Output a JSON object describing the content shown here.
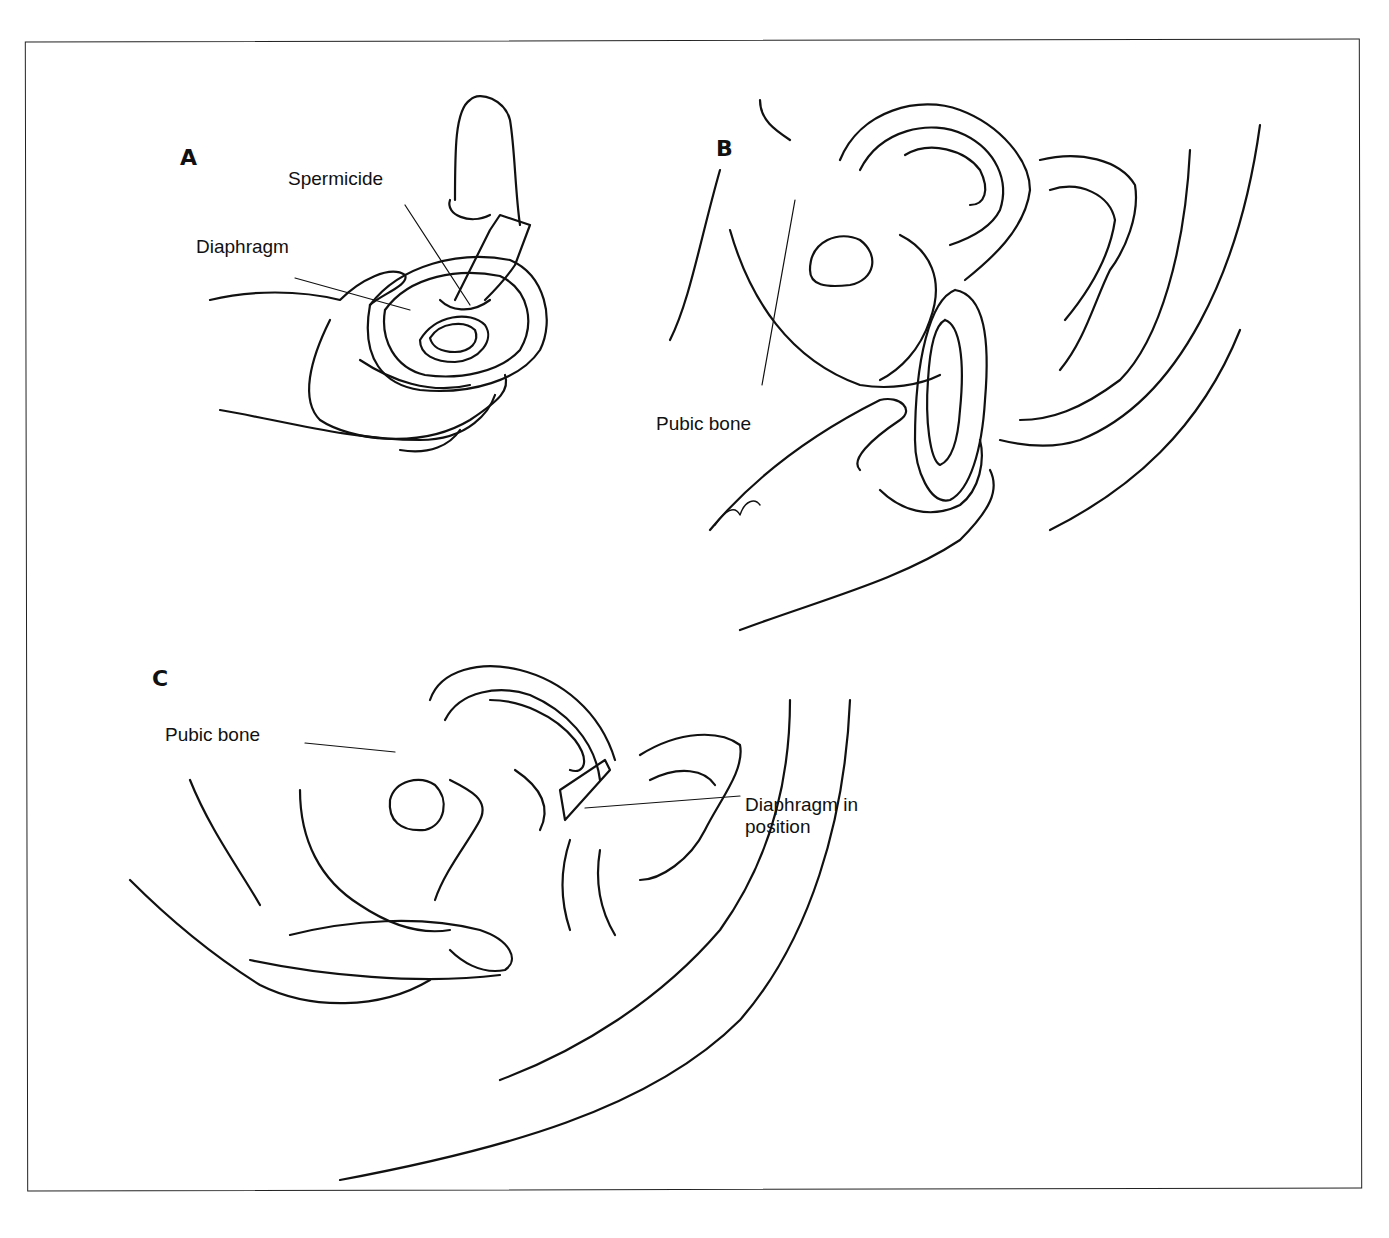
{
  "figure": {
    "panels": [
      {
        "letter": "A",
        "labels": [
          "Spermicide",
          "Diaphragm"
        ]
      },
      {
        "letter": "B",
        "labels": [
          "Pubic bone"
        ]
      },
      {
        "letter": "C",
        "labels": [
          "Pubic bone",
          "Diaphragm in",
          "position"
        ]
      }
    ]
  }
}
